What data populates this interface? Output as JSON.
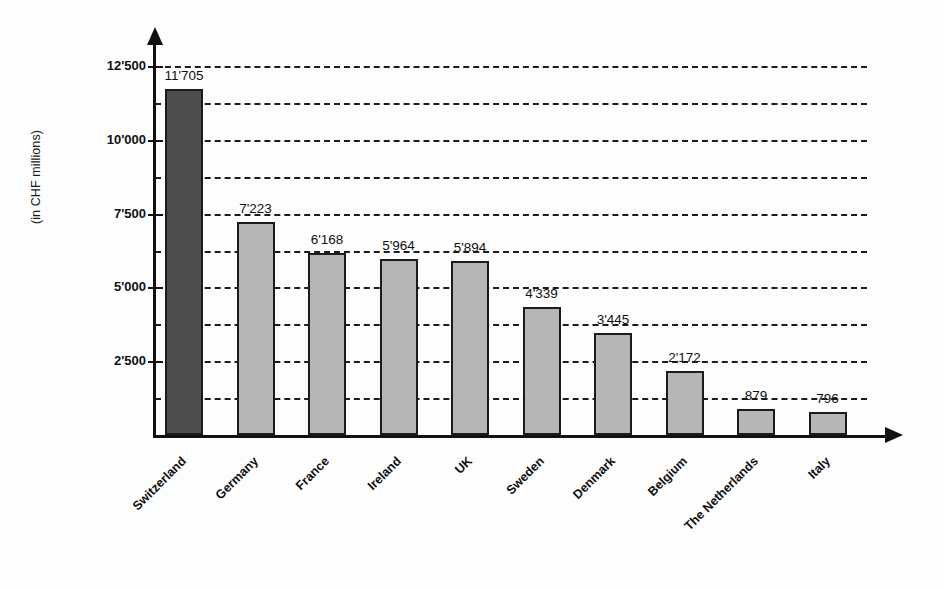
{
  "chart_data": {
    "type": "bar",
    "title": "",
    "xlabel": "",
    "ylabel": "(in CHF millions)",
    "categories": [
      "Switzerland",
      "Germany",
      "France",
      "Ireland",
      "UK",
      "Sweden",
      "Denmark",
      "Belgium",
      "The Netherlands",
      "Italy"
    ],
    "values": [
      11705,
      7223,
      6168,
      5964,
      5894,
      4339,
      3445,
      2172,
      879,
      796
    ],
    "value_labels": [
      "11'705",
      "7'223",
      "6'168",
      "5'964",
      "5'894",
      "4'339",
      "3'445",
      "2'172",
      "879",
      "796"
    ],
    "ylim": [
      0,
      12500
    ],
    "ytick_values": [
      2500,
      5000,
      7500,
      10000,
      12500
    ],
    "ytick_labels": [
      "2'500",
      "5'000",
      "7'500",
      "10'000",
      "12'500"
    ],
    "gridline_values": [
      1250,
      2500,
      3750,
      5000,
      6250,
      7500,
      8750,
      10000,
      11250,
      12500
    ],
    "grid": true,
    "legend": false,
    "highlight_index": 0,
    "colors": {
      "bar": "#b6b6b6",
      "bar_highlight": "#4d4d4d",
      "bar_outline": "#1b1b1b",
      "axis": "#111111",
      "grid": "#1c1c1c",
      "background": "#fdfdfd",
      "text": "#101010"
    }
  }
}
